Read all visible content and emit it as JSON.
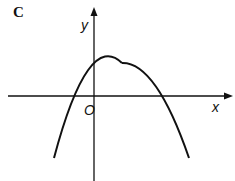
{
  "figure": {
    "label": "C",
    "axes": {
      "x_label": "x",
      "y_label": "y",
      "origin_label": "O"
    },
    "curve": {
      "type": "downward parabola",
      "description": "Parabola opening downward, vertex in first quadrant right of y-axis, positive y-intercept, one negative root and one positive root"
    }
  }
}
